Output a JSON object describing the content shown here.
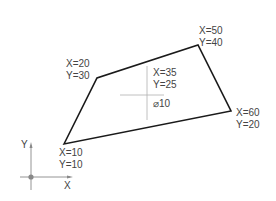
{
  "diagram": {
    "polygon": {
      "vertices": [
        {
          "x_label": "X=10",
          "y_label": "Y=10"
        },
        {
          "x_label": "X=20",
          "y_label": "Y=30"
        },
        {
          "x_label": "X=50",
          "y_label": "Y=40"
        },
        {
          "x_label": "X=60",
          "y_label": "Y=20"
        }
      ],
      "stroke_color": "#1a1a1a"
    },
    "hole": {
      "x_label": "X=35",
      "y_label": "Y=25",
      "diameter_label": "⌀10",
      "centerline_color": "#b0b0b0"
    },
    "axes": {
      "x_label": "X",
      "y_label": "Y",
      "color": "#888888"
    }
  }
}
